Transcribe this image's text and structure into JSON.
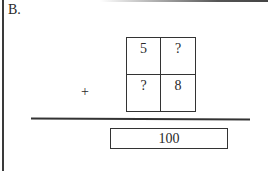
{
  "problem": {
    "label": "B.",
    "operator": "+",
    "grid": {
      "cells": [
        "5",
        "?",
        "?",
        "8"
      ]
    },
    "result": "100"
  },
  "colors": {
    "ink": "#333333",
    "background": "#ffffff"
  }
}
